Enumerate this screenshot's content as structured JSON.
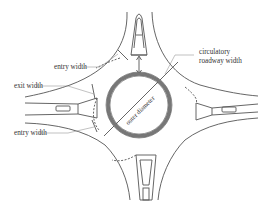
{
  "diagram": {
    "type": "roundabout-geometry",
    "colors": {
      "line": "#555555",
      "ring": "#777777",
      "background": "#ffffff",
      "text": "#333333"
    },
    "labels": {
      "entry_width_top": "entry width",
      "exit_width": "exit width",
      "entry_width_bottom": "entry width",
      "circulatory_line1": "circulatory",
      "circulatory_line2": "roadway width",
      "outer_diameter": "outer diameter"
    },
    "legs": [
      "north",
      "east",
      "south",
      "west"
    ]
  }
}
